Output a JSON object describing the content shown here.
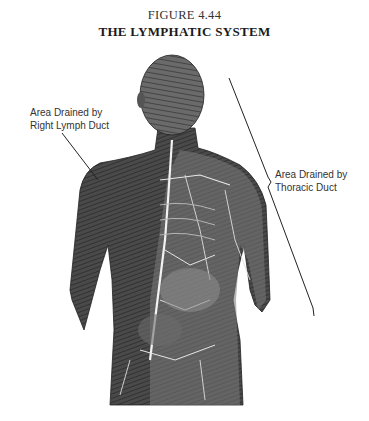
{
  "figure": {
    "number": "FIGURE 4.44",
    "title": "THE LYMPHATIC SYSTEM"
  },
  "labels": {
    "right_lymph_duct": {
      "line1": "Area Drained by",
      "line2": "Right Lymph Duct"
    },
    "thoracic_duct": {
      "line1": "Area Drained by",
      "line2": "Thoracic Duct"
    }
  },
  "illustration": {
    "subject": "anterior torso with lymphatic vessels",
    "style": "grayscale engraving"
  }
}
